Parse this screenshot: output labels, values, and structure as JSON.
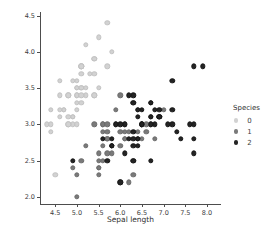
{
  "chart_data": {
    "type": "scatter",
    "title": "",
    "xlabel": "Sepal length",
    "ylabel": "Sepal width",
    "xlim": [
      4.15,
      8.3
    ],
    "ylim": [
      1.9,
      4.55
    ],
    "xticks": [
      4.5,
      5.0,
      5.5,
      6.0,
      6.5,
      7.0,
      7.5,
      8.0
    ],
    "xticklabels": [
      "4.5",
      "5.0",
      "5.5",
      "6.0",
      "6.5",
      "7.0",
      "7.5",
      "8.0"
    ],
    "yticks": [
      2.0,
      2.5,
      3.0,
      3.5,
      4.0,
      4.5
    ],
    "yticklabels": [
      "2.0",
      "2.5",
      "3.0",
      "3.5",
      "4.0",
      "4.5"
    ],
    "grid": false,
    "legend": {
      "title": "Species",
      "position": "right",
      "entries": [
        {
          "label": "0",
          "color": "#d2d2d2"
        },
        {
          "label": "1",
          "color": "#7a7a7a"
        },
        {
          "label": "2",
          "color": "#242424"
        }
      ]
    },
    "series": [
      {
        "name": "0",
        "color": "#d2d2d2",
        "points": [
          [
            5.1,
            3.5
          ],
          [
            4.9,
            3.0
          ],
          [
            4.7,
            3.2
          ],
          [
            4.6,
            3.1
          ],
          [
            5.0,
            3.6
          ],
          [
            5.4,
            3.9
          ],
          [
            4.6,
            3.4
          ],
          [
            5.0,
            3.4
          ],
          [
            4.4,
            2.9
          ],
          [
            4.9,
            3.1
          ],
          [
            5.4,
            3.7
          ],
          [
            4.8,
            3.4
          ],
          [
            4.8,
            3.0
          ],
          [
            4.3,
            3.0
          ],
          [
            5.8,
            4.0
          ],
          [
            5.7,
            4.4
          ],
          [
            5.4,
            3.9
          ],
          [
            5.1,
            3.5
          ],
          [
            5.7,
            3.8
          ],
          [
            5.1,
            3.8
          ],
          [
            5.4,
            3.4
          ],
          [
            5.1,
            3.7
          ],
          [
            4.6,
            3.6
          ],
          [
            5.1,
            3.3
          ],
          [
            4.8,
            3.4
          ],
          [
            5.0,
            3.0
          ],
          [
            5.0,
            3.4
          ],
          [
            5.2,
            3.5
          ],
          [
            5.2,
            3.4
          ],
          [
            4.7,
            3.2
          ],
          [
            4.8,
            3.1
          ],
          [
            5.4,
            3.4
          ],
          [
            5.2,
            4.1
          ],
          [
            5.5,
            4.2
          ],
          [
            4.9,
            3.1
          ],
          [
            5.0,
            3.2
          ],
          [
            5.5,
            3.5
          ],
          [
            4.9,
            3.6
          ],
          [
            4.4,
            3.0
          ],
          [
            5.1,
            3.4
          ],
          [
            5.0,
            3.5
          ],
          [
            4.5,
            2.3
          ],
          [
            4.4,
            3.2
          ],
          [
            5.0,
            3.5
          ],
          [
            5.1,
            3.8
          ],
          [
            4.8,
            3.0
          ],
          [
            5.1,
            3.8
          ],
          [
            4.6,
            3.2
          ],
          [
            5.3,
            3.7
          ],
          [
            5.0,
            3.3
          ]
        ]
      },
      {
        "name": "1",
        "color": "#7a7a7a",
        "points": [
          [
            7.0,
            3.2
          ],
          [
            6.4,
            3.2
          ],
          [
            6.9,
            3.1
          ],
          [
            5.5,
            2.3
          ],
          [
            6.5,
            2.8
          ],
          [
            5.7,
            2.8
          ],
          [
            6.3,
            3.3
          ],
          [
            4.9,
            2.4
          ],
          [
            6.6,
            2.9
          ],
          [
            5.2,
            2.7
          ],
          [
            5.0,
            2.0
          ],
          [
            5.9,
            3.0
          ],
          [
            6.0,
            2.2
          ],
          [
            6.1,
            2.9
          ],
          [
            5.6,
            2.9
          ],
          [
            6.7,
            3.1
          ],
          [
            5.6,
            3.0
          ],
          [
            5.8,
            2.7
          ],
          [
            6.2,
            2.2
          ],
          [
            5.6,
            2.5
          ],
          [
            5.9,
            3.2
          ],
          [
            6.1,
            2.8
          ],
          [
            6.3,
            2.5
          ],
          [
            6.1,
            2.8
          ],
          [
            6.4,
            2.9
          ],
          [
            6.6,
            3.0
          ],
          [
            6.8,
            2.8
          ],
          [
            6.7,
            3.0
          ],
          [
            6.0,
            2.9
          ],
          [
            5.7,
            2.6
          ],
          [
            5.5,
            2.4
          ],
          [
            5.5,
            2.4
          ],
          [
            5.8,
            2.7
          ],
          [
            6.0,
            2.7
          ],
          [
            5.4,
            3.0
          ],
          [
            6.0,
            3.4
          ],
          [
            6.7,
            3.1
          ],
          [
            6.3,
            2.3
          ],
          [
            5.6,
            3.0
          ],
          [
            5.5,
            2.5
          ],
          [
            5.5,
            2.6
          ],
          [
            6.1,
            3.0
          ],
          [
            5.8,
            2.6
          ],
          [
            5.0,
            2.3
          ],
          [
            5.6,
            2.7
          ],
          [
            5.7,
            3.0
          ],
          [
            5.7,
            2.9
          ],
          [
            6.2,
            2.9
          ],
          [
            5.1,
            2.5
          ],
          [
            5.7,
            2.8
          ]
        ]
      },
      {
        "name": "2",
        "color": "#242424",
        "points": [
          [
            6.3,
            3.3
          ],
          [
            5.8,
            2.7
          ],
          [
            7.1,
            3.0
          ],
          [
            6.3,
            2.9
          ],
          [
            6.5,
            3.0
          ],
          [
            7.6,
            3.0
          ],
          [
            4.9,
            2.5
          ],
          [
            7.3,
            2.9
          ],
          [
            6.7,
            2.5
          ],
          [
            7.2,
            3.6
          ],
          [
            6.5,
            3.2
          ],
          [
            6.4,
            2.7
          ],
          [
            6.8,
            3.0
          ],
          [
            5.7,
            2.5
          ],
          [
            5.8,
            2.8
          ],
          [
            6.4,
            3.2
          ],
          [
            6.5,
            3.0
          ],
          [
            7.7,
            3.8
          ],
          [
            7.7,
            2.6
          ],
          [
            6.0,
            2.2
          ],
          [
            6.9,
            3.2
          ],
          [
            5.6,
            2.8
          ],
          [
            7.7,
            2.8
          ],
          [
            6.3,
            2.7
          ],
          [
            6.7,
            3.3
          ],
          [
            7.2,
            3.2
          ],
          [
            6.2,
            2.8
          ],
          [
            6.1,
            3.0
          ],
          [
            6.4,
            2.8
          ],
          [
            7.2,
            3.0
          ],
          [
            7.4,
            2.8
          ],
          [
            7.9,
            3.8
          ],
          [
            6.4,
            2.8
          ],
          [
            6.3,
            2.8
          ],
          [
            6.1,
            2.6
          ],
          [
            7.7,
            3.0
          ],
          [
            6.3,
            3.4
          ],
          [
            6.4,
            3.1
          ],
          [
            6.0,
            3.0
          ],
          [
            6.9,
            3.1
          ],
          [
            6.7,
            3.1
          ],
          [
            6.9,
            3.1
          ],
          [
            5.8,
            2.7
          ],
          [
            6.8,
            3.2
          ],
          [
            6.7,
            3.3
          ],
          [
            6.7,
            3.0
          ],
          [
            6.3,
            2.5
          ],
          [
            6.5,
            3.0
          ],
          [
            6.2,
            3.4
          ],
          [
            5.9,
            3.0
          ]
        ]
      }
    ]
  }
}
